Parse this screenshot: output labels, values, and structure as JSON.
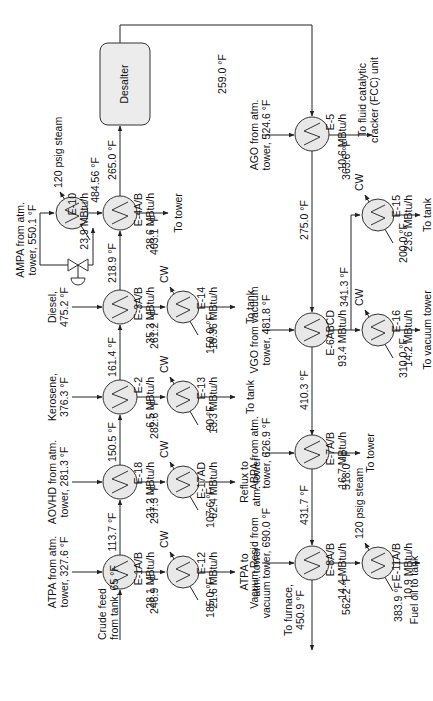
{
  "diagram": {
    "type": "process-flow-diagram",
    "orientation": "rotated-90-ccw",
    "colors": {
      "line": "#222222",
      "exchanger_fill": "#e8e8e8",
      "background": "#ffffff"
    },
    "units": {
      "desalter": {
        "label": "Desalter"
      }
    },
    "exchangers": [
      {
        "id": "E-1A/B",
        "duty": "28.1 MBtu/h"
      },
      {
        "id": "E-12",
        "duty": "21.6 MBtu/h"
      },
      {
        "id": "E-18",
        "duty": "21.2 MBtu/h"
      },
      {
        "id": "E-17AD",
        "duty": "62.4 MBtu/h"
      },
      {
        "id": "E-2",
        "duty": "6.5 MBtu/h"
      },
      {
        "id": "E-13",
        "duty": "13.3 MBtu/h"
      },
      {
        "id": "E-3A/B",
        "duty": "35.3 MBtu/h"
      },
      {
        "id": "E-14",
        "duty": "18.36 MBtu/h"
      },
      {
        "id": "E-4A/B",
        "duty": "28.6 MBtu/h"
      },
      {
        "id": "E-10",
        "duty": "23.9 MBtu/h"
      },
      {
        "id": "E-5",
        "duty": "10.6 MBtu/h"
      },
      {
        "id": "E-15",
        "duty": "23.6 MBtu/h"
      },
      {
        "id": "E-6ABCD",
        "duty": "93.4 MBtu/h"
      },
      {
        "id": "E-16",
        "duty": "14.2 MBtu/h"
      },
      {
        "id": "E-7A/B",
        "duty": "16.7 MBtu/h"
      },
      {
        "id": "E-8A/B",
        "duty": "14.4 MBtu/h"
      },
      {
        "id": "E-11A/B",
        "duty": "10.9 MBtu/h"
      }
    ],
    "streams": {
      "crude_feed": [
        "Crude feed",
        "from tank, 65 °F"
      ],
      "atpa_in": [
        "ATPA from atm.",
        "tower, 327.6 °F"
      ],
      "aovhd_in": [
        "AOVHD from atm.",
        "tower, 281.3 °F"
      ],
      "kerosene_in": [
        "Kerosene,",
        "376.3 °F"
      ],
      "diesel_in": [
        "Diesel,",
        "475.2 °F"
      ],
      "ampa_in": [
        "AMPA from atm.",
        "tower, 550.1 °F"
      ],
      "ago_in": [
        "AGO from atm.",
        "tower, 524.6 °F"
      ],
      "vgo_in": [
        "VGO from vacuum",
        "tower, 481.8 °F"
      ],
      "abpa_in": [
        "ABPA from atm.",
        "tower, 626.9 °F"
      ],
      "vresid_in": [
        "Vacuum Resid from",
        "vacuum tower, 690.0 °F"
      ],
      "atpa_out": [
        "ATPA to",
        "atm. tower"
      ],
      "reflux_out": [
        "Reflux to",
        "atm. tower"
      ],
      "kero_out": "To tank",
      "diesel_out": "To tank",
      "ampa_out": "To tower",
      "fcc_out": [
        "To fluid catalytic",
        "cracker (FCC) unit"
      ],
      "e15_out": "To tank",
      "e16_out": "To vacuum tower",
      "abpa_out": "To tower",
      "furnace_out": [
        "To furnace,",
        "450.9 °F"
      ],
      "fuel_oil_out": "Fuel oil to tank",
      "cw": "CW",
      "steam_e10": "120 psig steam",
      "steam_e11": "120 psig steam"
    },
    "temperatures": {
      "t_113_7": "113.7 °F",
      "t_246_9": "246.9 °F",
      "t_185_0": "185.0 °F",
      "t_150_5": "150.5 °F",
      "t_237_3": "237.3 °F",
      "t_107_6": "107.6 °F",
      "t_161_4": "161.4 °F",
      "t_282_6": "282.6 °F",
      "t_90": "90 °F",
      "t_218_9": "218.9 °F",
      "t_261_2": "261.2 °F",
      "t_150_0": "150.0 °F",
      "t_265_0": "265.0 °F",
      "t_484_56": "484.56 °F",
      "t_403_1": "403.1 °F",
      "t_259_0": "259.0 °F",
      "t_363_6": "363.6 °F",
      "t_275_0": "275.0 °F",
      "t_200_0": "200.0 °F",
      "t_341_3": "341.3 °F",
      "t_310_0": "310.0 °F",
      "t_410_3": "410.3 °F",
      "t_518_0": "518.0 °F",
      "t_431_7": "431.7 °F",
      "t_562_2": "562.2 °F",
      "t_383_9": "383.9 °F"
    }
  }
}
